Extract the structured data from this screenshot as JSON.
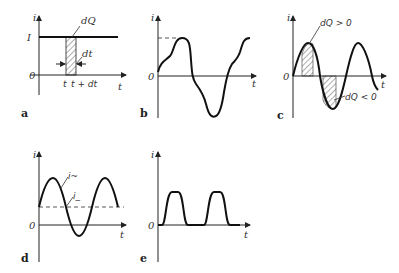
{
  "figure": {
    "panels": {
      "a": {
        "label": "a",
        "y_axis": "i",
        "x_axis": "t",
        "origin": "0",
        "level_label": "I",
        "area_label": "dQ",
        "width_label": "dt",
        "tick_t": "t",
        "tick_tdt": "t + dt"
      },
      "b": {
        "label": "b",
        "y_axis": "i",
        "x_axis": "t",
        "origin": "0"
      },
      "c": {
        "label": "c",
        "y_axis": "i",
        "x_axis": "t",
        "origin": "0",
        "pos_label": "dQ > 0",
        "neg_label": "dQ < 0"
      },
      "d": {
        "label": "d",
        "y_axis": "i",
        "x_axis": "t",
        "origin": "0",
        "ac_label": "i~",
        "dc_label": "i_"
      },
      "e": {
        "label": "e",
        "y_axis": "i",
        "x_axis": "t",
        "origin": "0"
      }
    }
  }
}
